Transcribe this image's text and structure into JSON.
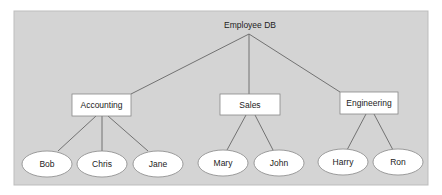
{
  "diagram": {
    "type": "tree",
    "background_color": "#d4d4d4",
    "root": {
      "label": "Employee DB"
    },
    "departments": [
      {
        "label": "Accounting",
        "employees": [
          "Bob",
          "Chris",
          "Jane"
        ]
      },
      {
        "label": "Sales",
        "employees": [
          "Mary",
          "John"
        ]
      },
      {
        "label": "Engineering",
        "employees": [
          "Harry",
          "Ron"
        ]
      }
    ]
  }
}
